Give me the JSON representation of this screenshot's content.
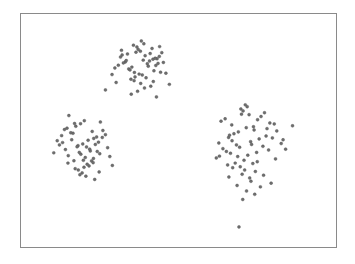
{
  "figure": {
    "title": "",
    "background_color": "#ffffff",
    "frame_color": "#8a8a8a",
    "marker_color": "#6e6e6e",
    "marker_edge_color": "#555555",
    "frame": {
      "left": 20,
      "top": 13,
      "width": 317,
      "height": 235
    }
  },
  "chart_data": {
    "type": "scatter",
    "title": "",
    "subtitle": "",
    "xlabel": "",
    "ylabel": "",
    "xlim": [
      0,
      100
    ],
    "ylim": [
      0,
      100
    ],
    "grid": false,
    "legend": null,
    "legend_position": "none",
    "xticks": [],
    "yticks": [],
    "xticklabels": [],
    "yticklabels": [],
    "annotations": [],
    "marker": "circle",
    "marker_size": 3,
    "n_points": 181,
    "clusters": [
      {
        "name": "upper-middle-cluster",
        "approx_center": [
          38,
          77
        ],
        "n": 56
      },
      {
        "name": "left-cluster",
        "approx_center": [
          19,
          45
        ],
        "n": 57
      },
      {
        "name": "right-cluster",
        "approx_center": [
          72,
          42
        ],
        "n": 68
      }
    ],
    "series": [
      {
        "name": "points",
        "color": "#6e6e6e",
        "x": [
          38.2,
          41.6,
          36.5,
          43.2,
          33.1,
          35.7,
          39.4,
          42.8,
          31.6,
          37.2,
          40.1,
          44.0,
          34.2,
          38.8,
          41.0,
          36.0,
          43.9,
          32.5,
          39.0,
          42.2,
          35.2,
          37.9,
          40.8,
          33.8,
          44.7,
          30.9,
          38.5,
          41.9,
          36.8,
          34.6,
          43.5,
          39.7,
          31.9,
          37.5,
          42.6,
          35.9,
          40.4,
          33.4,
          45.2,
          38.0,
          29.8,
          36.2,
          44.3,
          32.1,
          41.2,
          39.2,
          34.9,
          46.0,
          37.0,
          42.0,
          28.9,
          35.0,
          47.1,
          30.2,
          43.0,
          26.8,
          20.1,
          17.4,
          22.6,
          15.2,
          24.0,
          18.9,
          21.3,
          13.8,
          25.2,
          19.6,
          16.5,
          23.1,
          20.8,
          14.6,
          26.0,
          18.1,
          22.0,
          12.9,
          24.6,
          19.0,
          17.0,
          21.8,
          15.8,
          25.8,
          20.4,
          13.2,
          23.6,
          18.5,
          22.4,
          16.1,
          26.8,
          19.8,
          14.1,
          24.2,
          21.0,
          17.8,
          11.5,
          23.0,
          20.0,
          15.0,
          27.5,
          18.2,
          22.9,
          12.2,
          25.0,
          19.4,
          16.8,
          28.2,
          21.6,
          14.9,
          10.4,
          24.8,
          20.6,
          17.2,
          23.4,
          18.7,
          29.0,
          72.4,
          69.8,
          75.1,
          66.9,
          77.3,
          71.2,
          74.0,
          64.8,
          79.0,
          70.5,
          67.6,
          73.8,
          76.2,
          65.9,
          80.4,
          69.0,
          72.9,
          63.5,
          78.1,
          71.8,
          68.4,
          75.6,
          66.2,
          81.2,
          70.0,
          73.2,
          64.1,
          77.8,
          69.4,
          74.8,
          67.0,
          79.8,
          71.5,
          62.8,
          76.8,
          68.8,
          72.0,
          65.2,
          82.6,
          70.8,
          73.6,
          66.5,
          78.6,
          69.6,
          75.0,
          63.0,
          80.8,
          71.0,
          68.0,
          74.4,
          84.0,
          67.2,
          77.0,
          70.2,
          72.6,
          65.6,
          79.4,
          62.0,
          76.0,
          73.0,
          86.2,
          68.6,
          71.6,
          74.2,
          66.0,
          83.2,
          70.4,
          69.2
        ],
        "y": [
          88.4,
          85.2,
          83.6,
          80.8,
          79.4,
          86.6,
          82.1,
          77.9,
          81.5,
          84.8,
          78.6,
          86.0,
          76.4,
          80.2,
          83.0,
          74.9,
          81.8,
          79.0,
          87.2,
          75.6,
          77.2,
          84.0,
          79.8,
          82.8,
          83.4,
          78.0,
          73.8,
          80.6,
          85.8,
          76.0,
          78.8,
          72.6,
          84.4,
          74.2,
          81.0,
          71.4,
          77.6,
          80.0,
          79.2,
          70.2,
          76.8,
          73.0,
          75.0,
          82.4,
          69.0,
          68.2,
          72.0,
          74.6,
          66.8,
          71.0,
          74.0,
          65.6,
          69.8,
          70.6,
          64.4,
          67.4,
          54.2,
          51.8,
          49.6,
          56.4,
          47.2,
          52.9,
          45.8,
          50.4,
          53.6,
          44.2,
          48.8,
          46.6,
          42.9,
          51.0,
          50.0,
          43.5,
          41.2,
          47.8,
          45.0,
          39.8,
          53.0,
          42.0,
          49.0,
          47.0,
          38.4,
          44.8,
          44.0,
          40.6,
          36.9,
          46.0,
          48.2,
          37.2,
          41.8,
          41.0,
          35.5,
          43.0,
          45.6,
          38.0,
          34.2,
          39.2,
          42.6,
          33.0,
          36.2,
          43.8,
          40.0,
          31.8,
          37.0,
          38.8,
          34.8,
          36.0,
          40.4,
          32.2,
          30.4,
          33.6,
          29.0,
          31.0,
          35.0,
          56.8,
          59.2,
          54.6,
          52.4,
          57.6,
          61.0,
          50.2,
          55.0,
          53.2,
          58.4,
          48.6,
          51.6,
          56.0,
          47.0,
          52.8,
          49.4,
          45.2,
          54.0,
          50.8,
          60.2,
          43.8,
          46.4,
          48.0,
          49.8,
          57.0,
          44.0,
          42.2,
          47.6,
          42.8,
          40.6,
          45.6,
          46.8,
          51.2,
          44.6,
          43.2,
          38.8,
          39.4,
          41.0,
          44.4,
          37.2,
          35.8,
          40.2,
          41.6,
          34.4,
          36.6,
          39.0,
          37.8,
          33.0,
          36.0,
          32.4,
          42.0,
          34.0,
          30.8,
          31.2,
          29.6,
          35.2,
          27.4,
          38.2,
          25.8,
          28.2,
          52.0,
          26.4,
          24.0,
          22.6,
          30.0,
          46.0,
          20.4,
          8.6
        ]
      }
    ]
  }
}
